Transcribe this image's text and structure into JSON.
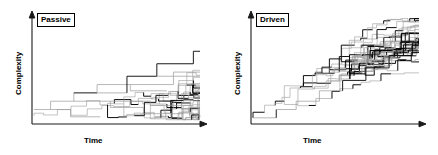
{
  "figure": {
    "background_color": "#ffffff",
    "line_color": "#000000",
    "line_color_light": "#9a9a9a"
  },
  "panels": [
    {
      "id": "passive",
      "label": "Passive",
      "xlabel": "Time",
      "ylabel": "Complexity",
      "axis": {
        "origin_x": 32,
        "origin_y": 124,
        "x_end": 206,
        "y_top": 14,
        "arrow": true
      },
      "chart_data": {
        "type": "line",
        "title": "Passive",
        "xlabel": "Time",
        "ylabel": "Complexity",
        "xlim": [
          0,
          100
        ],
        "ylim": [
          0,
          100
        ],
        "grid": false,
        "legend": false,
        "description": "Branching evolutionary tree diffusing from a left wall at low complexity; lineages spread both upward and remain near the minimum, producing a right-skewed fan.",
        "branches": [
          {
            "x0": 0,
            "y0": 12,
            "x1": 10,
            "y1": 12,
            "w": 0.7,
            "shade": "light"
          },
          {
            "x0": 10,
            "y0": 12,
            "x1": 10,
            "y1": 20,
            "w": 0.7,
            "shade": "light"
          },
          {
            "x0": 10,
            "y0": 20,
            "x1": 24,
            "y1": 20,
            "w": 0.7,
            "shade": "light"
          },
          {
            "x0": 10,
            "y0": 12,
            "x1": 22,
            "y1": 12,
            "w": 0.7,
            "shade": "light"
          },
          {
            "x0": 22,
            "y0": 12,
            "x1": 22,
            "y1": 5,
            "w": 0.7,
            "shade": "light"
          },
          {
            "x0": 22,
            "y0": 5,
            "x1": 40,
            "y1": 5,
            "w": 0.7,
            "shade": "light"
          },
          {
            "x0": 24,
            "y0": 20,
            "x1": 24,
            "y1": 28,
            "w": 0.7,
            "shade": "light"
          },
          {
            "x0": 24,
            "y0": 28,
            "x1": 38,
            "y1": 28,
            "w": 0.9,
            "shade": "dark"
          },
          {
            "x0": 24,
            "y0": 20,
            "x1": 46,
            "y1": 20,
            "w": 0.7,
            "shade": "light"
          },
          {
            "x0": 38,
            "y0": 28,
            "x1": 38,
            "y1": 36,
            "w": 0.7,
            "shade": "light"
          },
          {
            "x0": 38,
            "y0": 36,
            "x1": 58,
            "y1": 36,
            "w": 0.7,
            "shade": "light"
          },
          {
            "x0": 38,
            "y0": 28,
            "x1": 56,
            "y1": 28,
            "w": 0.7,
            "shade": "light"
          },
          {
            "x0": 46,
            "y0": 20,
            "x1": 46,
            "y1": 14,
            "w": 0.7,
            "shade": "light"
          },
          {
            "x0": 46,
            "y0": 14,
            "x1": 66,
            "y1": 14,
            "w": 0.7,
            "shade": "light"
          },
          {
            "x0": 46,
            "y0": 20,
            "x1": 70,
            "y1": 20,
            "w": 0.7,
            "shade": "light"
          },
          {
            "x0": 56,
            "y0": 28,
            "x1": 56,
            "y1": 44,
            "w": 0.9,
            "shade": "dark"
          },
          {
            "x0": 56,
            "y0": 44,
            "x1": 74,
            "y1": 44,
            "w": 0.9,
            "shade": "dark"
          },
          {
            "x0": 58,
            "y0": 36,
            "x1": 58,
            "y1": 30,
            "w": 0.7,
            "shade": "light"
          },
          {
            "x0": 58,
            "y0": 30,
            "x1": 80,
            "y1": 30,
            "w": 0.7,
            "shade": "light"
          },
          {
            "x0": 58,
            "y0": 36,
            "x1": 84,
            "y1": 36,
            "w": 0.7,
            "shade": "light"
          },
          {
            "x0": 66,
            "y0": 14,
            "x1": 66,
            "y1": 8,
            "w": 0.7,
            "shade": "light"
          },
          {
            "x0": 66,
            "y0": 8,
            "x1": 90,
            "y1": 8,
            "w": 0.7,
            "shade": "light"
          },
          {
            "x0": 70,
            "y0": 20,
            "x1": 70,
            "y1": 16,
            "w": 0.7,
            "shade": "light"
          },
          {
            "x0": 70,
            "y0": 16,
            "x1": 96,
            "y1": 16,
            "w": 0.7,
            "shade": "light"
          },
          {
            "x0": 74,
            "y0": 44,
            "x1": 74,
            "y1": 56,
            "w": 0.9,
            "shade": "dark"
          },
          {
            "x0": 74,
            "y0": 56,
            "x1": 96,
            "y1": 56,
            "w": 0.9,
            "shade": "dark"
          },
          {
            "x0": 74,
            "y0": 44,
            "x1": 100,
            "y1": 44,
            "w": 0.7,
            "shade": "light"
          },
          {
            "x0": 84,
            "y0": 36,
            "x1": 84,
            "y1": 48,
            "w": 0.7,
            "shade": "light"
          },
          {
            "x0": 84,
            "y0": 48,
            "x1": 100,
            "y1": 48,
            "w": 0.7,
            "shade": "light"
          },
          {
            "x0": 96,
            "y0": 56,
            "x1": 96,
            "y1": 68,
            "w": 0.9,
            "shade": "dark"
          },
          {
            "x0": 96,
            "y0": 68,
            "x1": 100,
            "y1": 68,
            "w": 0.9,
            "shade": "dark"
          }
        ]
      }
    },
    {
      "id": "driven",
      "label": "Driven",
      "xlabel": "Time",
      "ylabel": "Complexity",
      "axis": {
        "origin_x": 32,
        "origin_y": 124,
        "x_end": 206,
        "y_top": 14,
        "arrow": true
      },
      "chart_data": {
        "type": "line",
        "title": "Driven",
        "xlabel": "Time",
        "ylabel": "Complexity",
        "xlim": [
          0,
          100
        ],
        "ylim": [
          0,
          100
        ],
        "grid": false,
        "legend": false,
        "description": "Branching evolutionary tree with a directional bias; the whole distribution marches upward in a staircase so that both the minimum and maximum complexity increase with time.",
        "branches": [
          {
            "x0": 0,
            "y0": 4,
            "x1": 14,
            "y1": 4,
            "w": 0.7,
            "shade": "light"
          },
          {
            "x0": 14,
            "y0": 4,
            "x1": 14,
            "y1": 12,
            "w": 0.9,
            "shade": "dark"
          },
          {
            "x0": 14,
            "y0": 12,
            "x1": 26,
            "y1": 12,
            "w": 0.7,
            "shade": "light"
          },
          {
            "x0": 26,
            "y0": 12,
            "x1": 26,
            "y1": 20,
            "w": 0.7,
            "shade": "light"
          },
          {
            "x0": 26,
            "y0": 20,
            "x1": 40,
            "y1": 20,
            "w": 0.7,
            "shade": "light"
          },
          {
            "x0": 40,
            "y0": 20,
            "x1": 40,
            "y1": 30,
            "w": 0.7,
            "shade": "light"
          },
          {
            "x0": 40,
            "y0": 30,
            "x1": 54,
            "y1": 30,
            "w": 0.7,
            "shade": "light"
          },
          {
            "x0": 54,
            "y0": 30,
            "x1": 54,
            "y1": 40,
            "w": 0.9,
            "shade": "dark"
          },
          {
            "x0": 54,
            "y0": 40,
            "x1": 68,
            "y1": 40,
            "w": 0.9,
            "shade": "dark"
          },
          {
            "x0": 68,
            "y0": 40,
            "x1": 68,
            "y1": 52,
            "w": 0.9,
            "shade": "dark"
          },
          {
            "x0": 68,
            "y0": 52,
            "x1": 82,
            "y1": 52,
            "w": 0.9,
            "shade": "dark"
          },
          {
            "x0": 82,
            "y0": 52,
            "x1": 82,
            "y1": 64,
            "w": 0.9,
            "shade": "dark"
          },
          {
            "x0": 82,
            "y0": 64,
            "x1": 96,
            "y1": 64,
            "w": 0.9,
            "shade": "dark"
          },
          {
            "x0": 96,
            "y0": 64,
            "x1": 96,
            "y1": 76,
            "w": 0.9,
            "shade": "dark"
          },
          {
            "x0": 96,
            "y0": 76,
            "x1": 100,
            "y1": 76,
            "w": 0.9,
            "shade": "dark"
          }
        ]
      }
    }
  ]
}
